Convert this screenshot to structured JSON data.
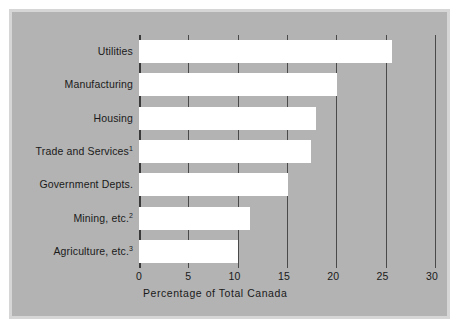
{
  "chart_data": {
    "type": "bar",
    "orientation": "horizontal",
    "title": "",
    "xlabel": "Percentage of Total Canada",
    "ylabel": "",
    "xlim": [
      0,
      30
    ],
    "xticks": [
      "0",
      "5",
      "10",
      "15",
      "20",
      "25",
      "30"
    ],
    "xtick_values": [
      0,
      5,
      10,
      15,
      20,
      25,
      30
    ],
    "grid": "vertical",
    "legend": "none",
    "categories": [
      "Utilities",
      "Manufacturing",
      "Housing",
      "Trade and Services",
      "Government Depts.",
      "Mining, etc.",
      "Agriculture, etc."
    ],
    "category_superscripts": [
      "",
      "",
      "",
      "1",
      "",
      "2",
      "3"
    ],
    "values": [
      25.6,
      20.1,
      17.9,
      17.4,
      15.1,
      11.2,
      10.0
    ],
    "bar_color": "#ffffff",
    "panel_color": "#b3b3b3",
    "frame_color": "#d6d6d6",
    "gridline_color": "#4a4a4a",
    "text_color": "#1a1a1a"
  }
}
